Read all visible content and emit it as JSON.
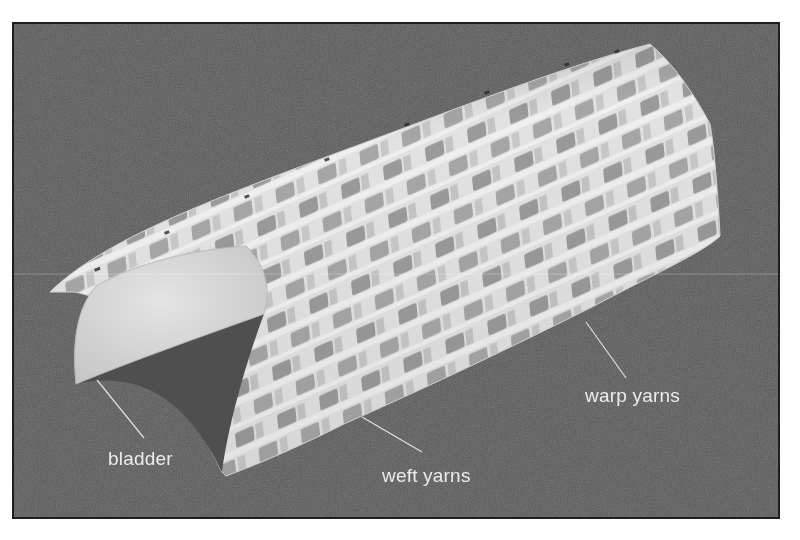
{
  "figure": {
    "background_color": "#5b5b5b",
    "border_color": "#1e1e1e",
    "labels": [
      {
        "id": "bladder",
        "text": "bladder"
      },
      {
        "id": "weft",
        "text": "weft yarns"
      },
      {
        "id": "warp",
        "text": "warp yarns"
      }
    ],
    "colors": {
      "yarn_light": "#e6e6e6",
      "yarn_mid": "#b4b4b4",
      "yarn_dark": "#8e8e8e",
      "bladder": "#d8d8d8",
      "leader_line": "#e0e0e0"
    }
  }
}
